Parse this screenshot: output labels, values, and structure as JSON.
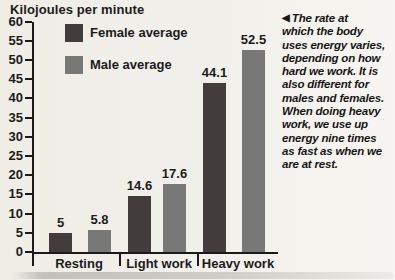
{
  "chart_data": {
    "type": "bar",
    "title": "Kilojoules per minute",
    "categories": [
      "Resting",
      "Light work",
      "Heavy work"
    ],
    "series": [
      {
        "id": "female",
        "name": "Female average",
        "color": "#433c3d",
        "values": [
          5,
          14.6,
          44.1
        ]
      },
      {
        "id": "male",
        "name": "Male average",
        "color": "#787876",
        "values": [
          5.8,
          17.6,
          52.5
        ]
      }
    ],
    "value_labels": [
      [
        "5",
        "14.6",
        "44.1"
      ],
      [
        "5.8",
        "17.6",
        "52.5"
      ]
    ],
    "ylim": [
      0,
      60
    ],
    "ytick_step": 5,
    "grid": false,
    "legend_position": "top-left"
  },
  "annotation": {
    "arrow_icon": "◀",
    "text": "The rate at\nwhich the body\nuses energy varies,\ndepending on how\nhard we work. It is\nalso different for\nmales and females.\nWhen doing heavy\nwork, we use up\nenergy nine times\nas fast as when we\nare at rest."
  },
  "colors": {
    "paper": "#f2f0ea",
    "female_bar": "#433c3d",
    "male_bar": "#787876",
    "ink": "#1b1b1b"
  }
}
